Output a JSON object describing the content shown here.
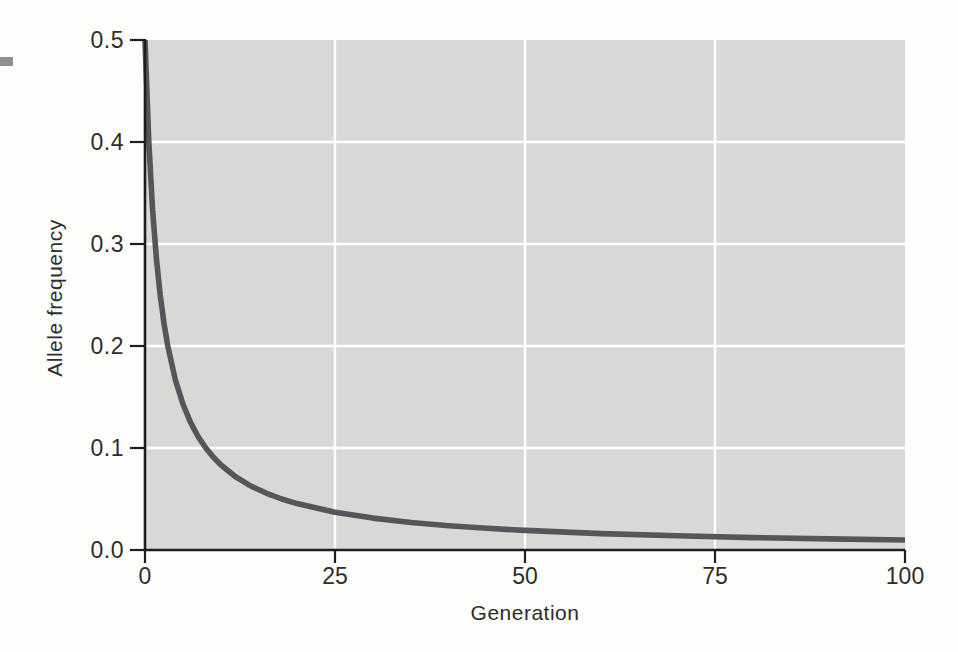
{
  "colors": {
    "page_background": "#fdfdfb",
    "plot_background": "#d8d8d7",
    "gridline": "#ffffff",
    "axis": "#1e1e1e",
    "curve": "#55565a",
    "text": "#2e2d2b",
    "margin_marker": "#8f8f8f"
  },
  "chart_data": {
    "type": "line",
    "title": "",
    "xlabel": "Generation",
    "ylabel": "Allele frequency",
    "xlim": [
      0,
      100
    ],
    "ylim": [
      0,
      0.5
    ],
    "xticks": {
      "values": [
        0,
        25,
        50,
        75,
        100
      ],
      "labels": [
        "0",
        "25",
        "50",
        "75",
        "100"
      ]
    },
    "yticks": {
      "values": [
        0,
        0.1,
        0.2,
        0.3,
        0.4,
        0.5
      ],
      "labels": [
        "0.0",
        "0.1",
        "0.2",
        "0.3",
        "0.4",
        "0.5"
      ]
    },
    "grid": {
      "vertical_at": [
        25,
        50,
        75
      ],
      "horizontal_at": [
        0.1,
        0.2,
        0.3,
        0.4
      ]
    },
    "legend": "none",
    "series": [
      {
        "name": "allele frequency decline under selection",
        "color": "#55565a",
        "points": [
          [
            0,
            0.5
          ],
          [
            0.5,
            0.4
          ],
          [
            1,
            0.3333
          ],
          [
            1.5,
            0.2857
          ],
          [
            2,
            0.25
          ],
          [
            2.5,
            0.2222
          ],
          [
            3,
            0.2
          ],
          [
            4,
            0.1667
          ],
          [
            5,
            0.1429
          ],
          [
            6,
            0.125
          ],
          [
            7,
            0.1111
          ],
          [
            8,
            0.1
          ],
          [
            9,
            0.0909
          ],
          [
            10,
            0.0833
          ],
          [
            12,
            0.0714
          ],
          [
            14,
            0.0625
          ],
          [
            16,
            0.0556
          ],
          [
            18,
            0.05
          ],
          [
            20,
            0.0455
          ],
          [
            25,
            0.037
          ],
          [
            30,
            0.0313
          ],
          [
            35,
            0.027
          ],
          [
            40,
            0.0238
          ],
          [
            45,
            0.0213
          ],
          [
            50,
            0.0192
          ],
          [
            60,
            0.0161
          ],
          [
            70,
            0.0139
          ],
          [
            80,
            0.0122
          ],
          [
            90,
            0.0109
          ],
          [
            100,
            0.0098
          ]
        ]
      }
    ]
  }
}
